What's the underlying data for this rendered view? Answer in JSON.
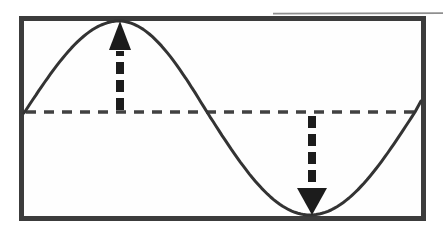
{
  "figure": {
    "kind": "sine-wave-amplitude-diagram",
    "canvas": {
      "width": 443,
      "height": 237,
      "background": "#ffffff"
    },
    "frame": {
      "x": 19,
      "y": 16,
      "width": 407,
      "height": 205,
      "stroke": "#3c3c3c",
      "stroke_width": 5,
      "fill": "#fefefe"
    },
    "midline": {
      "x1": 26,
      "x2": 420,
      "y": 112,
      "stroke": "#414141",
      "stroke_width": 3.4,
      "dash": "10 8"
    },
    "wave": {
      "stroke": "#333333",
      "stroke_width": 3,
      "keypoints": [
        {
          "x": 24,
          "y": 113,
          "type": "start-crossing-up"
        },
        {
          "x": 119,
          "y": 21,
          "type": "peak"
        },
        {
          "x": 207,
          "y": 112,
          "type": "crossing-down"
        },
        {
          "x": 310,
          "y": 215,
          "type": "trough"
        },
        {
          "x": 415,
          "y": 112,
          "type": "crossing-up"
        },
        {
          "x": 421,
          "y": 101,
          "type": "end"
        }
      ],
      "easings": [
        "sin",
        "cos",
        "sin",
        "cos",
        "linear"
      ]
    },
    "arrows": {
      "up": {
        "direction": "up",
        "color": "#1c1c1c",
        "x": 120,
        "shaft_y1": 110,
        "shaft_y2": 51,
        "head_base_y": 50,
        "tip_y": 21,
        "head_half_width": 11,
        "shaft_width": 8,
        "dash": "12 6"
      },
      "down": {
        "direction": "down",
        "color": "#1c1c1c",
        "x": 312,
        "shaft_y1": 116,
        "shaft_y2": 189,
        "head_base_y": 188,
        "tip_y": 215,
        "head_half_width": 15,
        "shaft_width": 8,
        "dash": "12 6"
      }
    },
    "scan_artifact": {
      "x1": 273,
      "y1": 13.7,
      "x2": 443,
      "y2": 13.2,
      "stroke": "#8f8f8f",
      "stroke_width": 1.8
    }
  }
}
